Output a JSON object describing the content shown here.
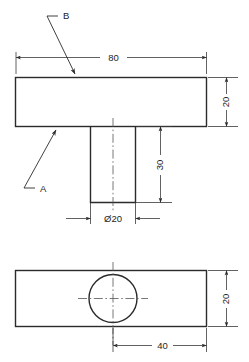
{
  "drawing": {
    "title": "Engineering part drawing - T-shaped block with through hole",
    "background_color": "#ffffff",
    "line_color": "#2b2b2b",
    "dimension_color": "#3a3a3a",
    "views": {
      "front": {
        "name": "front-elevation-view",
        "top_block": {
          "width_label": "80",
          "height_label": "20"
        },
        "stem": {
          "height_label": "30",
          "diameter_label": "Ø20"
        }
      },
      "plan": {
        "name": "plan-view",
        "height_label": "20",
        "offset_label": "40"
      }
    },
    "labels": {
      "b": "B",
      "a": "A"
    },
    "dimensions": {
      "overall_width": "80",
      "block_thickness": "20",
      "stem_height": "30",
      "hole_diameter": "Ø20",
      "plan_height": "20",
      "hole_center_offset": "40"
    }
  }
}
